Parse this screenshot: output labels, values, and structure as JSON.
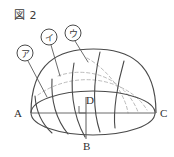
{
  "figure": {
    "caption": "図 2",
    "background_color": "#ffffff",
    "stroke_color": "#4a4a4a",
    "hidden_stroke_color": "#b9b9b9",
    "leader_color": "#5a5a5a"
  },
  "point_labels": [
    {
      "id": "A",
      "text": "A",
      "x": 14,
      "y": 117
    },
    {
      "id": "B",
      "text": "B",
      "x": 83,
      "y": 150
    },
    {
      "id": "C",
      "text": "C",
      "x": 160,
      "y": 117
    },
    {
      "id": "D",
      "text": "D",
      "x": 86,
      "y": 104
    }
  ],
  "callouts": [
    {
      "id": "a",
      "text": "ア",
      "cx": 25,
      "cy": 53,
      "r": 8,
      "tip_x": 47,
      "tip_y": 96
    },
    {
      "id": "i",
      "text": "イ",
      "cx": 49,
      "cy": 37,
      "r": 8,
      "tip_x": 59,
      "tip_y": 74
    },
    {
      "id": "u",
      "text": "ウ",
      "cx": 73,
      "cy": 33,
      "r": 8,
      "tip_x": 86,
      "tip_y": 60
    }
  ],
  "shape": {
    "type": "hemisphere-dome",
    "dome_left_x": 31,
    "dome_right_x": 156,
    "dome_apex_y": 49,
    "base_center_x": 93,
    "base_center_y": 113,
    "base_rx": 62,
    "base_ry": 22,
    "diameter_line": {
      "x1": 31,
      "y1": 113,
      "x2": 156,
      "y2": 113
    },
    "vertical_segment": {
      "x1": 86,
      "y1": 97,
      "x2": 86,
      "y2": 139
    }
  },
  "curves": {
    "solid_count": 4,
    "dashed_count": 3,
    "description": "curves on dome surface converging toward B"
  }
}
